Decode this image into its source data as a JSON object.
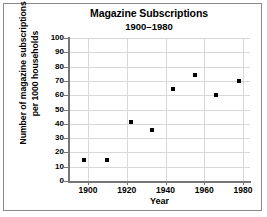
{
  "chart_data": {
    "type": "scatter",
    "title": "Magazine Subscriptions",
    "subtitle": "1900–1980",
    "xlabel": "Year",
    "ylabel_line1": "Number of magazine subscriptions",
    "ylabel_line2": "per 1000 households",
    "xlim": [
      1900,
      1980
    ],
    "ylim": [
      0,
      100
    ],
    "xticks": [
      1900,
      1920,
      1940,
      1960,
      1980
    ],
    "yticks": [
      0,
      10,
      20,
      30,
      40,
      50,
      60,
      70,
      80,
      90,
      100
    ],
    "grid": true,
    "legend": "none",
    "marker_color": "#000000",
    "grid_color": "#d8d8d8",
    "axis_color": "#777777",
    "points": [
      {
        "x": 1898,
        "y": 15
      },
      {
        "x": 1910,
        "y": 15
      },
      {
        "x": 1922,
        "y": 41
      },
      {
        "x": 1933,
        "y": 36
      },
      {
        "x": 1944,
        "y": 64
      },
      {
        "x": 1955,
        "y": 74
      },
      {
        "x": 1966,
        "y": 60
      },
      {
        "x": 1978,
        "y": 70
      }
    ]
  }
}
